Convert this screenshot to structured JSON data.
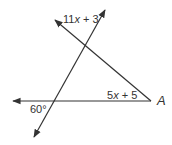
{
  "diagram": {
    "labels": {
      "top_angle": "11x + 3",
      "top_angle_parts": {
        "coef": "11",
        "var": "x",
        "rest": " + 3"
      },
      "right_angle": "5x + 5",
      "right_angle_parts": {
        "coef": "5",
        "var": "x",
        "rest": " + 5"
      },
      "bottom_angle": "60°",
      "vertex": "A"
    },
    "colors": {
      "line": "#333333",
      "background": "#ffffff"
    },
    "lines": [
      {
        "name": "horizontal-line",
        "from": [
          151,
          101
        ],
        "to": [
          13,
          101
        ],
        "arrow_end": "left"
      },
      {
        "name": "transversal-line",
        "from": [
          34,
          137
        ],
        "to": [
          105,
          10
        ],
        "arrows": "both"
      },
      {
        "name": "slanted-line",
        "from": [
          151,
          101
        ],
        "to": [
          55,
          20
        ],
        "arrow_end": "upper-left"
      }
    ]
  }
}
